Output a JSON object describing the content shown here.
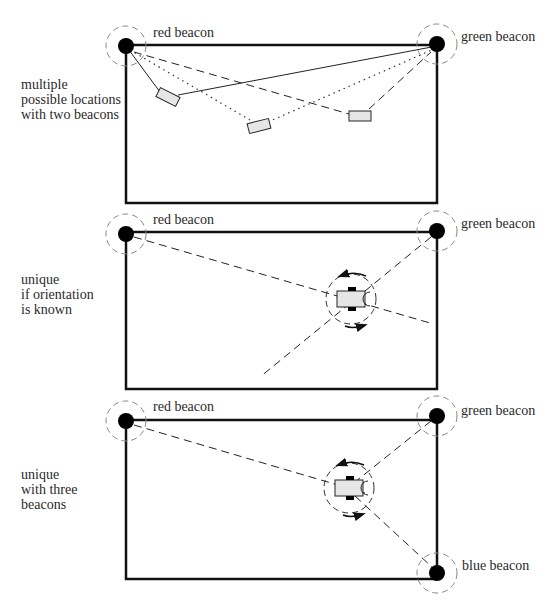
{
  "panels": [
    {
      "id": "two-beacons",
      "caption_lines": [
        "multiple",
        "possible locations",
        "with two beacons"
      ],
      "beacons": [
        {
          "label": "red beacon",
          "x": 126,
          "y": 46
        },
        {
          "label": "green beacon",
          "x": 437,
          "y": 44
        }
      ],
      "robots": [
        {
          "x": 168,
          "y": 97,
          "angle": 27
        },
        {
          "x": 259,
          "y": 126,
          "angle": -14
        },
        {
          "x": 360,
          "y": 116,
          "angle": 0
        }
      ]
    },
    {
      "id": "orientation-known",
      "caption_lines": [
        "unique",
        "if orientation",
        "is known"
      ],
      "beacons": [
        {
          "label": "red beacon",
          "x": 126,
          "y": 234
        },
        {
          "label": "green beacon",
          "x": 437,
          "y": 231
        }
      ],
      "robots": [
        {
          "x": 351,
          "y": 299,
          "angle": 0
        }
      ]
    },
    {
      "id": "three-beacons",
      "caption_lines": [
        "unique",
        "with three",
        "beacons"
      ],
      "beacons": [
        {
          "label": "red beacon",
          "x": 126,
          "y": 421
        },
        {
          "label": "green beacon",
          "x": 437,
          "y": 416
        },
        {
          "label": "blue beacon",
          "x": 437,
          "y": 573
        }
      ],
      "robots": [
        {
          "x": 349,
          "y": 488,
          "angle": 0
        }
      ]
    }
  ],
  "colors": {
    "frame": "#111111",
    "beacon": "#000000",
    "halo": "#888888",
    "robot_fill": "#e6e6e6",
    "line": "#222222"
  }
}
